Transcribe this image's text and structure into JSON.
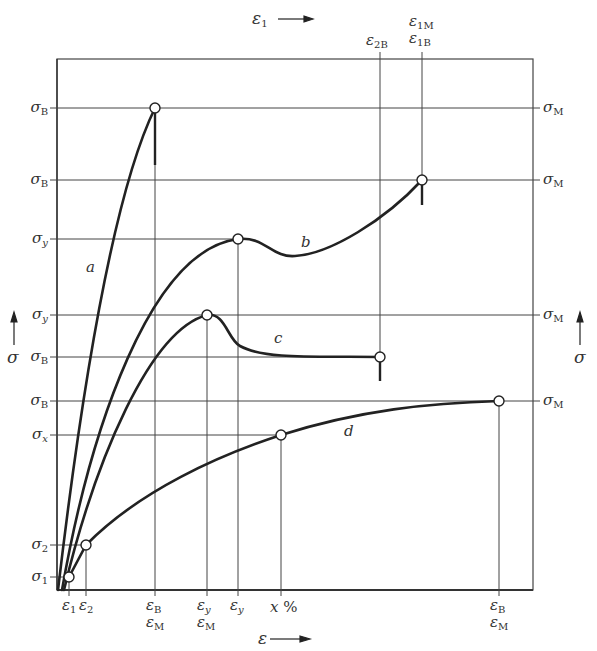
{
  "diagram": {
    "type": "stress-strain diagram",
    "frame": {
      "left": 57,
      "top": 59,
      "right": 533,
      "bottom": 590
    },
    "top_axis": {
      "symbol": "ε",
      "sub": "1",
      "arrow": "→"
    },
    "bottom_axis": {
      "symbol": "ε",
      "arrow": "→"
    },
    "left_axis": {
      "symbol": "σ",
      "arrow": "↑"
    },
    "right_axis": {
      "symbol": "σ",
      "arrow": "↑"
    },
    "curves": [
      {
        "id": "a",
        "label": "a",
        "description": "brittle, ends at σB / εB with fracture"
      },
      {
        "id": "b",
        "label": "b",
        "description": "yield point σy at εy, then rises to σB at ε1B"
      },
      {
        "id": "c",
        "label": "c",
        "description": "yield point σy at εy/εM, drops to σB at ε2B"
      },
      {
        "id": "d",
        "label": "d",
        "description": "no yield point, σx at x%, σB at εB"
      }
    ],
    "left_labels": [
      {
        "sym": "σ",
        "sub": "B",
        "y": 108
      },
      {
        "sym": "σ",
        "sub": "B",
        "y": 180
      },
      {
        "sym": "σ",
        "sub": "y",
        "y": 239
      },
      {
        "sym": "σ",
        "sub": "y",
        "y": 315
      },
      {
        "sym": "σ",
        "sub": "B",
        "y": 357
      },
      {
        "sym": "σ",
        "sub": "B",
        "y": 401
      },
      {
        "sym": "σ",
        "sub": "x",
        "y": 435
      },
      {
        "sym": "σ",
        "sub": "2",
        "y": 545
      },
      {
        "sym": "σ",
        "sub": "1",
        "y": 577
      }
    ],
    "right_labels": [
      {
        "sym": "σ",
        "sub": "M",
        "y": 108
      },
      {
        "sym": "σ",
        "sub": "M",
        "y": 180
      },
      {
        "sym": "σ",
        "sub": "M",
        "y": 315
      },
      {
        "sym": "σ",
        "sub": "M",
        "y": 401
      }
    ],
    "bottom_labels": [
      {
        "line1": "ε1",
        "line2": "",
        "x": 69
      },
      {
        "line1": "ε2",
        "line2": "",
        "x": 86
      },
      {
        "line1": "εB",
        "line2": "εM",
        "x": 155
      },
      {
        "line1": "εy",
        "line2": "εM",
        "x": 207
      },
      {
        "line1": "εy",
        "line2": "",
        "x": 238
      },
      {
        "line1": "x %",
        "line2": "",
        "x": 281
      },
      {
        "line1": "εB",
        "line2": "εM",
        "x": 499
      }
    ],
    "top_labels": [
      {
        "line1": "",
        "line2": "ε2B",
        "x": 380
      },
      {
        "line1": "ε1M",
        "line2": "ε1B",
        "x": 422
      }
    ]
  },
  "labels": {
    "top_eps": "ε",
    "top_eps_sub": "1",
    "bottom_eps": "ε",
    "left_sigma": "σ",
    "right_sigma": "σ",
    "curve_a": "a",
    "curve_b": "b",
    "curve_c": "c",
    "curve_d": "d",
    "L0s": "σ",
    "L0b": "B",
    "L1s": "σ",
    "L1b": "B",
    "L2s": "σ",
    "L2b": "y",
    "L3s": "σ",
    "L3b": "y",
    "L4s": "σ",
    "L4b": "B",
    "L5s": "σ",
    "L5b": "B",
    "L6s": "σ",
    "L6b": "x",
    "L7s": "σ",
    "L7b": "2",
    "L8s": "σ",
    "L8b": "1",
    "R0s": "σ",
    "R0b": "M",
    "R1s": "σ",
    "R1b": "M",
    "R2s": "σ",
    "R2b": "M",
    "R3s": "σ",
    "R3b": "M",
    "B0s": "ε",
    "B0b": "1",
    "B1s": "ε",
    "B1b": "2",
    "B2s": "ε",
    "B2b": "B",
    "B2s2": "ε",
    "B2b2": "M",
    "B3s": "ε",
    "B3b": "y",
    "B3s2": "ε",
    "B3b2": "M",
    "B4s": "ε",
    "B4b": "y",
    "B5": "x",
    "B5p": "%",
    "B6s": "ε",
    "B6b": "B",
    "B6s2": "ε",
    "B6b2": "M",
    "T0s": "ε",
    "T0b": "2B",
    "T1s": "ε",
    "T1b": "1M",
    "T1s2": "ε",
    "T1b2": "1B"
  }
}
